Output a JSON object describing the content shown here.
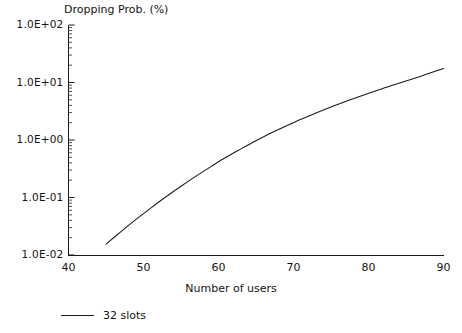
{
  "chart_data": {
    "type": "line",
    "title": "Dropping Prob. (%)",
    "xlabel": "Number of users",
    "ylabel": "Dropping Prob. (%)",
    "yscale": "log",
    "xscale": "linear",
    "xlim": [
      40,
      90
    ],
    "ylim": [
      0.01,
      100
    ],
    "grid": false,
    "legend_position": "below-bottom-left",
    "x_ticks": [
      40,
      50,
      60,
      70,
      80,
      90
    ],
    "x_tick_labels": [
      "40",
      "50",
      "60",
      "70",
      "80",
      "90"
    ],
    "y_ticks": [
      0.01,
      0.1,
      1,
      10,
      100
    ],
    "y_tick_labels": [
      "1.0E-02",
      "1.0E-01",
      "1.0E+00",
      "1.0E+01",
      "1.0E+02"
    ],
    "series": [
      {
        "name": "32 slots",
        "color": "#1a1a1a",
        "x": [
          45,
          47,
          49,
          51,
          53,
          55,
          57,
          59,
          61,
          63,
          65,
          67,
          69,
          71,
          73,
          75,
          77,
          79,
          81,
          83,
          85,
          87,
          89,
          90
        ],
        "y": [
          0.0155,
          0.0255,
          0.0415,
          0.066,
          0.103,
          0.157,
          0.235,
          0.345,
          0.5,
          0.7,
          0.97,
          1.32,
          1.75,
          2.3,
          2.95,
          3.75,
          4.7,
          5.85,
          7.2,
          8.8,
          10.6,
          12.9,
          15.8,
          17.5
        ]
      }
    ],
    "annotations": []
  },
  "legend": {
    "entries": [
      {
        "label": "32 slots",
        "marker": "line"
      }
    ]
  }
}
